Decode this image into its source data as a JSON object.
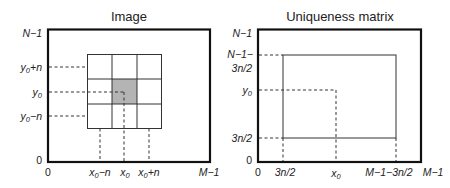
{
  "panels": [
    {
      "title": "Image",
      "y_labels": {
        "top": "N−1",
        "y0_plus_n": "y0+n",
        "y0": "y0",
        "y0_minus_n": "y0−n",
        "bottom": "0"
      },
      "x_labels": {
        "left": "0",
        "x0_minus_n": "x0−n",
        "x0": "x0",
        "x0_plus_n": "x0+n",
        "right": "M−1"
      },
      "grid": "3x3 neighborhood centered at (x0, y0), center cell shaded"
    },
    {
      "title": "Uniqueness matrix",
      "y_labels": {
        "top": "N−1",
        "inner_top_1": "N−1−",
        "inner_top_2": "3n/2",
        "y0": "y0",
        "inner_bottom": "3n/2",
        "bottom": "0"
      },
      "x_labels": {
        "left": "0",
        "inner_left": "3n/2",
        "x0": "x0",
        "inner_right": "M−1−3n/2",
        "right": "M−1"
      }
    }
  ],
  "colors": {
    "frame": "#111111",
    "shade": "#b4b4b4",
    "background": "#ffffff"
  }
}
